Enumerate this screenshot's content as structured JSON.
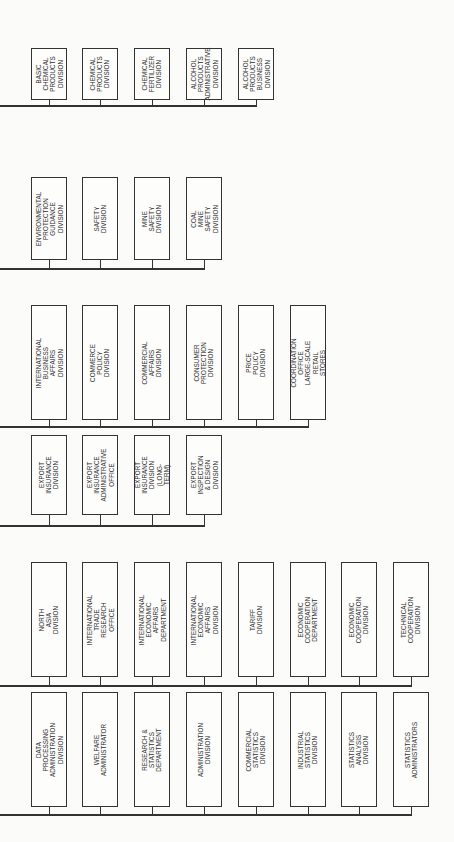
{
  "diagram": {
    "orientation": "rotated-90-ccw",
    "bands": [
      {
        "id": "band-1",
        "boxes": [
          {
            "label": "BASIC CHEMICAL\nPRODUCTS\nDIVISION"
          },
          {
            "label": "CHEMICAL\nPRODUCTS\nDIVISION"
          },
          {
            "label": "CHEMICAL\nFERTILIZER\nDIVISION"
          },
          {
            "label": "ALCOHOL PRODUCTS\nADMINISTRATIVE DIVISION"
          },
          {
            "label": "ALCOHOL PRODUCTS\nBUSINESS DIVISION"
          }
        ]
      },
      {
        "id": "band-2",
        "boxes": [
          {
            "label": "ENVIRONMENTAL\nPROTECTION\nGUIDANCE DIVISION"
          },
          {
            "label": "SAFETY\nDIVISION"
          },
          {
            "label": "MINE SAFETY\nDIVISION"
          },
          {
            "label": "COAL MINE\nSAFETY\nDIVISION"
          }
        ]
      },
      {
        "id": "band-3",
        "boxes": [
          {
            "label": "INTERNATIONAL\nBUSINESS AFFAIRS\nDIVISION"
          },
          {
            "label": "COMMERCE\nPOLICY\nDIVISION"
          },
          {
            "label": "COMMERCIAL\nAFFAIRS\nDIVISION"
          },
          {
            "label": "CONSUMER\nPROTECTION\nDIVISION"
          },
          {
            "label": "PRICE POLICY\nDIVISION"
          },
          {
            "label": "COORDINATION OFFICE\nLARGE-SCALE RETAIL\nSTORES"
          }
        ]
      },
      {
        "id": "band-4",
        "boxes": [
          {
            "label": "EXPORT INSURANCE\nDIVISION"
          },
          {
            "label": "EXPORT INSURANCE\nADMINISTRATIVE OFFICE"
          },
          {
            "label": "EXPORT INSURANCE\nDIVISION\n(LONG-TERM)"
          },
          {
            "label": "EXPORT INSPECTION\n& DESIGN DIVISION"
          }
        ]
      },
      {
        "id": "band-5",
        "boxes": [
          {
            "label": "NORTH ASIA\nDIVISION"
          },
          {
            "label": "INTERNATIONAL\nTRADE RESEARCH\nOFFICE"
          },
          {
            "label": "INTERNATIONAL\nECONOMIC AFFAIRS\nDEPARTMENT"
          },
          {
            "label": "INTERNATIONAL\nECONOMIC AFFAIRS\nDIVISION"
          },
          {
            "label": "TARIFF\nDIVISION"
          },
          {
            "label": "ECONOMIC\nCOOPERATION\nDEPARTMENT"
          },
          {
            "label": "ECONOMIC\nCOOPERATION\nDIVISION"
          },
          {
            "label": "TECHNICAL\nCOOPERATION\nDIVISION"
          }
        ]
      },
      {
        "id": "band-6",
        "boxes": [
          {
            "label": "DATA PROCESSING\nADMINISTRATION\nDIVISION"
          },
          {
            "label": "WELFARE\nADMINISTRATOR"
          },
          {
            "label": "RESEARCH &\nSTATISTICS\nDEPARTMENT"
          },
          {
            "label": "ADMINISTRATION\nDIVISION"
          },
          {
            "label": "COMMERCIAL\nSTATISTICS\nDIVISION"
          },
          {
            "label": "INDUSTRIAL\nSTATISTICS\nDIVISION"
          },
          {
            "label": "STATISTICS\nANALYSIS\nDIVISION"
          },
          {
            "label": "STATISTICS\nADMINISTRATORS"
          }
        ]
      }
    ]
  }
}
